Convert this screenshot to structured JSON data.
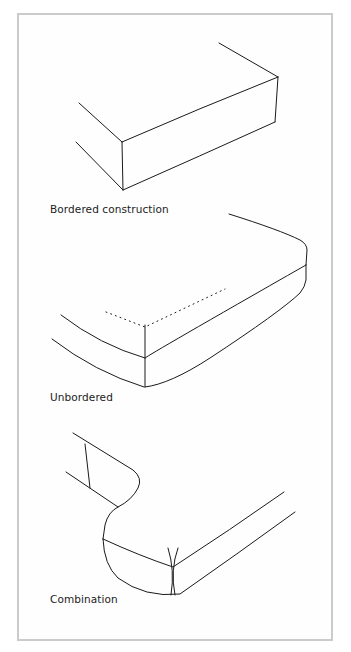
{
  "figure": {
    "panels": [
      {
        "label": "Bordered construction"
      },
      {
        "label": "Unbordered"
      },
      {
        "label": "Combination"
      }
    ]
  },
  "colors": {
    "frame_border": "#cbcbcb",
    "line": "#1a1a1a",
    "background": "#ffffff"
  }
}
